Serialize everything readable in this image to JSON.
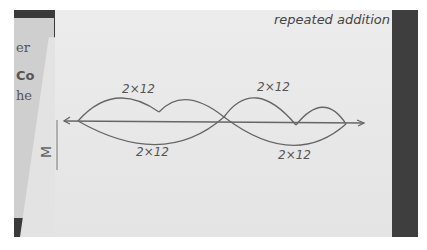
{
  "photo": {
    "title": "repeated addition",
    "background_fragments": [
      "er",
      "Co",
      "he"
    ],
    "slanted_paper_glyph": "M",
    "diagram": {
      "type": "number-line-jumps",
      "top_labels": [
        "2×12",
        "2×12"
      ],
      "bottom_labels": [
        "2×12",
        "2×12"
      ],
      "top_jumps_count": 4,
      "bottom_jumps_count": 2
    }
  }
}
